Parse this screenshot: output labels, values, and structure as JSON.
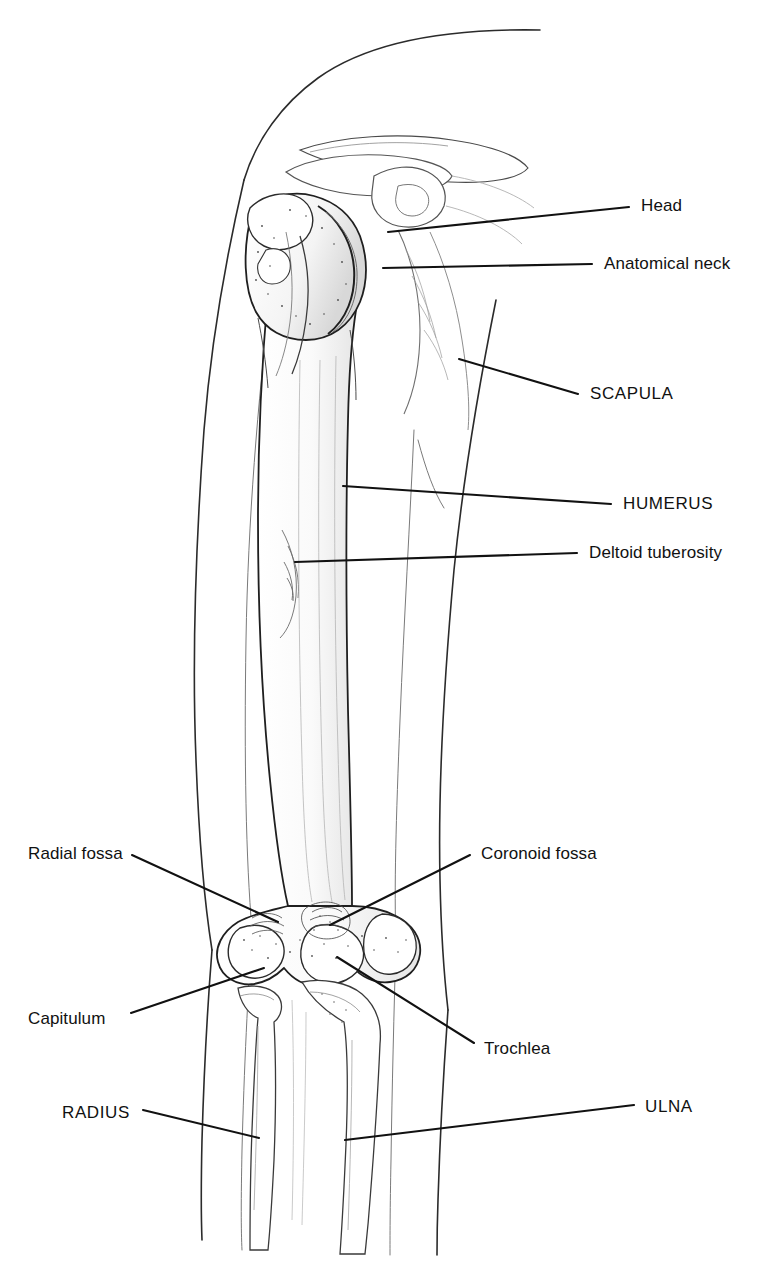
{
  "figure": {
    "view": "anterior",
    "style": "line-drawing",
    "background_color": "#ffffff",
    "ink_color": "#111111",
    "leader_color": "#111111"
  },
  "labels": {
    "head": "Head",
    "anatomical_neck": "Anatomical neck",
    "scapula": "SCAPULA",
    "humerus": "HUMERUS",
    "deltoid_tuberosity": "Deltoid tuberosity",
    "radial_fossa": "Radial fossa",
    "coronoid_fossa": "Coronoid fossa",
    "capitulum": "Capitulum",
    "trochlea": "Trochlea",
    "radius": "RADIUS",
    "ulna": "ULNA"
  },
  "annotations": [
    {
      "id": "head",
      "text": "Head",
      "emphasis": "normal",
      "side": "right",
      "label_x": 641,
      "label_y": 197,
      "leader_from": [
        629,
        207
      ],
      "leader_to": [
        388,
        232
      ]
    },
    {
      "id": "anatomical-neck",
      "text": "Anatomical neck",
      "emphasis": "normal",
      "side": "right",
      "label_x": 604,
      "label_y": 255,
      "leader_from": [
        592,
        264
      ],
      "leader_to": [
        383,
        268
      ]
    },
    {
      "id": "scapula",
      "text": "SCAPULA",
      "emphasis": "caps",
      "side": "right",
      "label_x": 590,
      "label_y": 385,
      "leader_from": [
        578,
        394
      ],
      "leader_to": [
        459,
        359
      ]
    },
    {
      "id": "humerus",
      "text": "HUMERUS",
      "emphasis": "caps",
      "side": "right",
      "label_x": 623,
      "label_y": 495,
      "leader_from": [
        611,
        504
      ],
      "leader_to": [
        343,
        486
      ]
    },
    {
      "id": "deltoid-tuberosity",
      "text": "Deltoid tuberosity",
      "emphasis": "normal",
      "side": "right",
      "label_x": 589,
      "label_y": 544,
      "leader_from": [
        577,
        553
      ],
      "leader_to": [
        295,
        562
      ]
    },
    {
      "id": "radial-fossa",
      "text": "Radial fossa",
      "emphasis": "normal",
      "side": "left",
      "label_x": 28,
      "label_y": 845,
      "leader_from": [
        132,
        855
      ],
      "leader_to": [
        278,
        922
      ]
    },
    {
      "id": "coronoid-fossa",
      "text": "Coronoid fossa",
      "emphasis": "normal",
      "side": "right",
      "label_x": 481,
      "label_y": 845,
      "leader_from": [
        470,
        855
      ],
      "leader_to": [
        330,
        925
      ]
    },
    {
      "id": "capitulum",
      "text": "Capitulum",
      "emphasis": "normal",
      "side": "left",
      "label_x": 28,
      "label_y": 1010,
      "leader_from": [
        131,
        1013
      ],
      "leader_to": [
        264,
        968
      ]
    },
    {
      "id": "trochlea",
      "text": "Trochlea",
      "emphasis": "normal",
      "side": "right",
      "label_x": 484,
      "label_y": 1040,
      "leader_from": [
        474,
        1043
      ],
      "leader_to": [
        337,
        957
      ]
    },
    {
      "id": "radius",
      "text": "RADIUS",
      "emphasis": "caps",
      "side": "left",
      "label_x": 62,
      "label_y": 1104,
      "leader_from": [
        143,
        1110
      ],
      "leader_to": [
        259,
        1138
      ]
    },
    {
      "id": "ulna",
      "text": "ULNA",
      "emphasis": "caps",
      "side": "right",
      "label_x": 645,
      "label_y": 1098,
      "leader_from": [
        634,
        1105
      ],
      "leader_to": [
        345,
        1140
      ]
    }
  ],
  "structures": [
    {
      "id": "arm-silhouette",
      "name": "arm soft-tissue outline"
    },
    {
      "id": "humerus-bone",
      "name": "humerus"
    },
    {
      "id": "scapula-bone",
      "name": "scapula"
    },
    {
      "id": "clavicle-bone",
      "name": "clavicle"
    },
    {
      "id": "radius-bone",
      "name": "radius"
    },
    {
      "id": "ulna-bone",
      "name": "ulna"
    }
  ]
}
